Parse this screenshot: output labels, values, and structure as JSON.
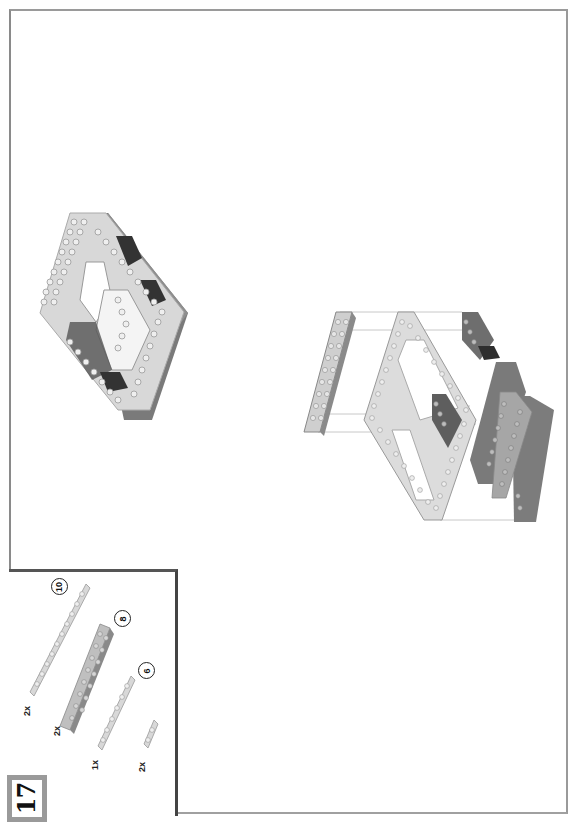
{
  "page": {
    "orientation": "rotated-90-ccw",
    "step_number": "17"
  },
  "parts_list": {
    "items": [
      {
        "quantity": "2x",
        "length": "10",
        "part": "light gray 1x10 plate"
      },
      {
        "quantity": "2x",
        "length": "8",
        "part": "light gray 2x8 plate"
      },
      {
        "quantity": "1x",
        "length": "6",
        "part": "light gray 1x6 plate"
      },
      {
        "quantity": "2x",
        "length": "",
        "part": "light gray 1x2 plate"
      }
    ]
  },
  "illustrations": {
    "assembled_model": "completed frame sub-assembly",
    "exploded_view": "plates placed onto brick frame with guide lines"
  },
  "colors": {
    "frame_border": "#9a9a9a",
    "parts_box_border": "#444444",
    "light_gray_brick": "#d6d6d6",
    "dark_gray_brick": "#6e6e6e",
    "medium_gray_brick": "#9c9c9c"
  }
}
